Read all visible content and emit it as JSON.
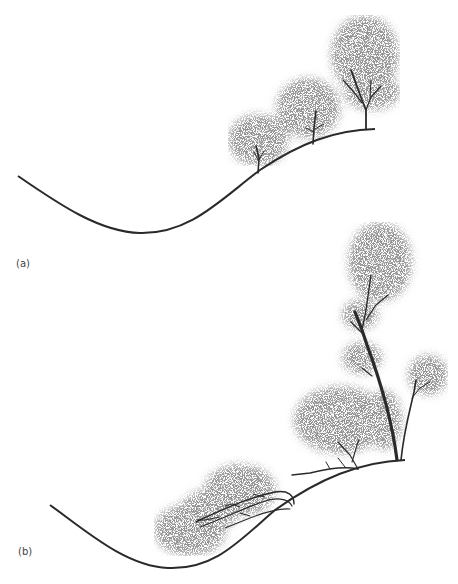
{
  "panels": [
    {
      "id": "a",
      "label": "(a)"
    },
    {
      "id": "b",
      "label": "(b)"
    }
  ],
  "colors": {
    "line": "#2a2a2a",
    "stipple": "#555555",
    "background": "#ffffff"
  }
}
